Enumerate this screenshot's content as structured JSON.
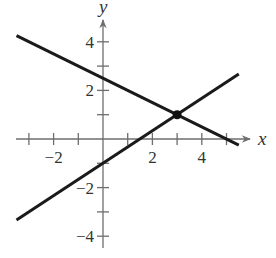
{
  "chart_data": {
    "type": "line",
    "title": "",
    "xlabel": "x",
    "ylabel": "y",
    "xlim": [
      -3.5,
      5.5
    ],
    "ylim": [
      -4.5,
      4.8
    ],
    "grid": false,
    "legend": null,
    "x_ticks": [
      -3,
      -2,
      -1,
      1,
      2,
      3,
      4,
      5
    ],
    "x_tick_labels": [
      {
        "value": -2,
        "label": "−2"
      },
      {
        "value": 2,
        "label": "2"
      },
      {
        "value": 4,
        "label": "4"
      }
    ],
    "y_ticks": [
      -4,
      -3,
      -2,
      -1,
      1,
      2,
      3,
      4
    ],
    "y_tick_labels": [
      {
        "value": 4,
        "label": "4"
      },
      {
        "value": 2,
        "label": "2"
      },
      {
        "value": -2,
        "label": "−2"
      },
      {
        "value": -4,
        "label": "−4"
      }
    ],
    "series": [
      {
        "name": "line 1 (decreasing)",
        "equation": "y = -0.5x + 2.5",
        "x": [
          -3.5,
          5.5
        ],
        "y": [
          4.25,
          -0.25
        ]
      },
      {
        "name": "line 2 (increasing)",
        "equation": "y = (2/3)x - 1",
        "x": [
          -3.5,
          5.5
        ],
        "y": [
          -3.33,
          2.67
        ]
      }
    ],
    "annotations": [
      {
        "type": "point",
        "x": 3,
        "y": 1,
        "label": "intersection"
      }
    ]
  },
  "labels": {
    "x_axis": "x",
    "y_axis": "y"
  }
}
